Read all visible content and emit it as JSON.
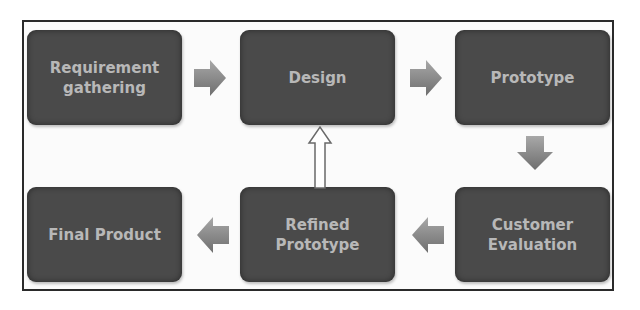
{
  "diagram": {
    "title": "",
    "nodes": [
      {
        "id": "requirement-gathering",
        "label": "Requirement\ngathering"
      },
      {
        "id": "design",
        "label": "Design"
      },
      {
        "id": "prototype",
        "label": "Prototype"
      },
      {
        "id": "customer-evaluation",
        "label": "Customer\nEvaluation"
      },
      {
        "id": "refined-prototype",
        "label": "Refined\nPrototype"
      },
      {
        "id": "final-product",
        "label": "Final Product"
      }
    ],
    "edges": [
      {
        "from": "requirement-gathering",
        "to": "design",
        "direction": "right"
      },
      {
        "from": "design",
        "to": "prototype",
        "direction": "right"
      },
      {
        "from": "prototype",
        "to": "customer-evaluation",
        "direction": "down"
      },
      {
        "from": "customer-evaluation",
        "to": "refined-prototype",
        "direction": "left"
      },
      {
        "from": "refined-prototype",
        "to": "final-product",
        "direction": "left"
      },
      {
        "from": "refined-prototype",
        "to": "design",
        "direction": "up",
        "style": "outline"
      }
    ],
    "colors": {
      "box_fill": "#4a4a4a",
      "box_text": "#b8b8b8",
      "arrow_fill": "#8c8c8c",
      "frame_border": "#2a2a2a"
    }
  }
}
